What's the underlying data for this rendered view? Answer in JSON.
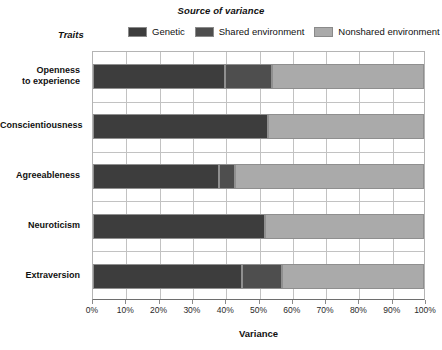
{
  "header": {
    "legend_title": "Source of variance",
    "traits_label": "Traits"
  },
  "legend": {
    "items": [
      {
        "label": "Genetic",
        "color": "#3d3d3d",
        "key": "genetic"
      },
      {
        "label": "Shared environment",
        "color": "#4e4e4e",
        "key": "shared"
      },
      {
        "label": "Nonshared environment",
        "color": "#aaaaaa",
        "key": "nonshared"
      }
    ]
  },
  "chart_data": {
    "type": "bar",
    "orientation": "horizontal",
    "stacked": true,
    "title": "Source of variance",
    "xlabel": "Variance",
    "ylabel": "Traits",
    "xlim": [
      0,
      100
    ],
    "xunit": "%",
    "grid": true,
    "legend_position": "top",
    "categories": [
      "Openness to experience",
      "Conscientiousness",
      "Agreeableness",
      "Neuroticism",
      "Extraversion"
    ],
    "category_lines": [
      [
        "Openness",
        "to experience"
      ],
      [
        "Conscientiousness"
      ],
      [
        "Agreeableness"
      ],
      [
        "Neuroticism"
      ],
      [
        "Extraversion"
      ]
    ],
    "series": [
      {
        "name": "Genetic",
        "color": "#3d3d3d",
        "values": [
          40,
          53,
          38,
          52,
          45
        ]
      },
      {
        "name": "Shared environment",
        "color": "#4e4e4e",
        "values": [
          14,
          0,
          5,
          0,
          12
        ]
      },
      {
        "name": "Nonshared environment",
        "color": "#aaaaaa",
        "values": [
          46,
          47,
          57,
          48,
          43
        ]
      }
    ],
    "xticks": [
      0,
      10,
      20,
      30,
      40,
      50,
      60,
      70,
      80,
      90,
      100
    ],
    "xtick_labels": [
      "0%",
      "10%",
      "20%",
      "30%",
      "40%",
      "50%",
      "60%",
      "70%",
      "80%",
      "90%",
      "100%"
    ]
  },
  "axis": {
    "x_title": "Variance"
  }
}
